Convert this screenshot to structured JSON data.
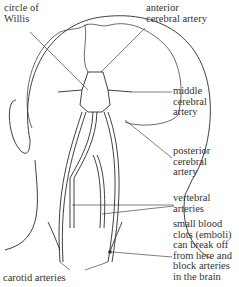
{
  "diagram": {
    "labels": {
      "circle_of_willis": "circle of\nWillis",
      "anterior_cerebral": "anterior\ncerebral artery",
      "middle_cerebral": "middle\ncerebral\nartery",
      "posterior_cerebral": "posterior\ncerebral\nartery",
      "vertebral": "vertebral\narteries",
      "emboli_note": "small blood\nclots (emboli)\ncan break off\nfrom here and\nblock arteries\nin the brain",
      "carotid": "carotid arteries"
    },
    "colors": {
      "line": "#2a2a2a",
      "background": "#ffffff"
    }
  }
}
